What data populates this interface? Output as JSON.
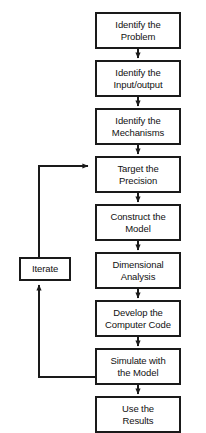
{
  "diagram": {
    "type": "flowchart",
    "title": "",
    "orientation": "top-to-bottom",
    "background_color": "#ffffff",
    "line_color": "#1a1a1a",
    "box_fill_color": "#ffffff",
    "text_color": "#111111",
    "nodes": [
      {
        "id": "identify-problem",
        "label": "Identify the\nProblem",
        "x": 95,
        "y": 12,
        "w": 86,
        "h": 37
      },
      {
        "id": "identify-io",
        "label": "Identify the\nInput/output",
        "x": 95,
        "y": 60,
        "w": 86,
        "h": 37
      },
      {
        "id": "identify-mechanisms",
        "label": "Identify the\nMechanisms",
        "x": 95,
        "y": 108,
        "w": 86,
        "h": 37
      },
      {
        "id": "target-precision",
        "label": "Target the\nPrecision",
        "x": 95,
        "y": 156,
        "w": 86,
        "h": 37
      },
      {
        "id": "construct-model",
        "label": "Construct the\nModel",
        "x": 95,
        "y": 204,
        "w": 86,
        "h": 37
      },
      {
        "id": "dimensional-analysis",
        "label": "Dimensional\nAnalysis",
        "x": 95,
        "y": 252,
        "w": 86,
        "h": 37
      },
      {
        "id": "develop-code",
        "label": "Develop the\nComputer Code",
        "x": 95,
        "y": 300,
        "w": 86,
        "h": 37
      },
      {
        "id": "simulate-model",
        "label": "Simulate with\nthe Model",
        "x": 95,
        "y": 348,
        "w": 86,
        "h": 37
      },
      {
        "id": "use-results",
        "label": "Use the\nResults",
        "x": 95,
        "y": 396,
        "w": 86,
        "h": 37
      },
      {
        "id": "iterate",
        "label": "Iterate",
        "x": 19,
        "y": 257,
        "w": 52,
        "h": 24
      }
    ],
    "edges": [
      {
        "from": "identify-problem",
        "to": "identify-io",
        "kind": "straight-down"
      },
      {
        "from": "identify-io",
        "to": "identify-mechanisms",
        "kind": "straight-down"
      },
      {
        "from": "identify-mechanisms",
        "to": "target-precision",
        "kind": "straight-down"
      },
      {
        "from": "target-precision",
        "to": "construct-model",
        "kind": "straight-down"
      },
      {
        "from": "construct-model",
        "to": "dimensional-analysis",
        "kind": "straight-down"
      },
      {
        "from": "dimensional-analysis",
        "to": "develop-code",
        "kind": "straight-down"
      },
      {
        "from": "develop-code",
        "to": "simulate-model",
        "kind": "straight-down"
      },
      {
        "from": "simulate-model",
        "to": "use-results",
        "kind": "straight-down"
      },
      {
        "from": "use-results",
        "to": "iterate",
        "kind": "feedback-left-up"
      },
      {
        "from": "iterate",
        "to": "target-precision",
        "kind": "feedback-up-right"
      }
    ]
  }
}
